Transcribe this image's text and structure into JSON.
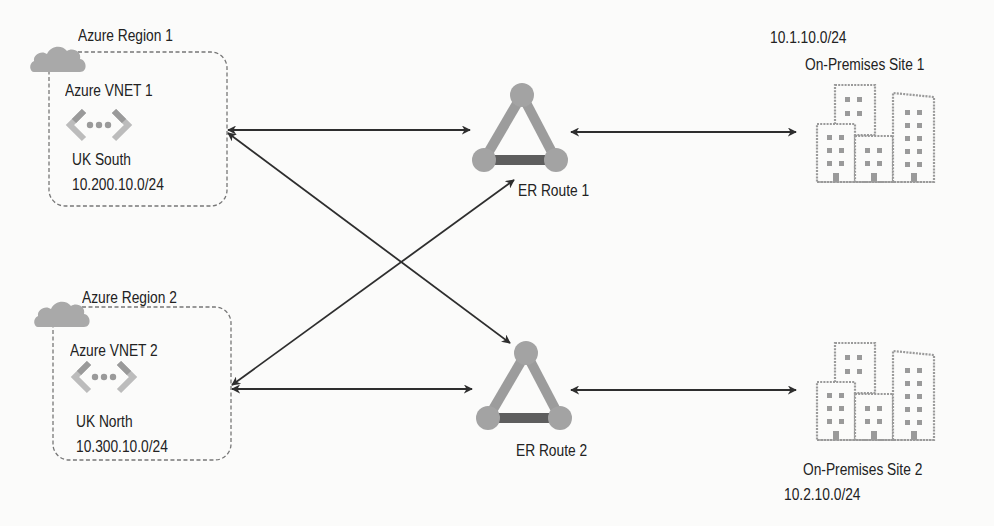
{
  "regions": [
    {
      "title": "Azure Region 1",
      "vnet": "Azure VNET 1",
      "location": "UK South",
      "cidr": "10.200.10.0/24",
      "icons": [
        "cloud-icon",
        "vnet-icon"
      ]
    },
    {
      "title": "Azure Region 2",
      "vnet": "Azure VNET 2",
      "location": "UK North",
      "cidr": "10.300.10.0/24",
      "icons": [
        "cloud-icon",
        "vnet-icon"
      ]
    }
  ],
  "routes": [
    {
      "label": "ER Route 1",
      "icon": "expressroute-circuit-icon"
    },
    {
      "label": "ER Route 2",
      "icon": "expressroute-circuit-icon"
    }
  ],
  "sites": [
    {
      "label": "On-Premises Site 1",
      "cidr": "10.1.10.0/24",
      "icon": "buildings-icon"
    },
    {
      "label": "On-Premises Site 2",
      "cidr": "10.2.10.0/24",
      "icon": "buildings-icon"
    }
  ],
  "connections": [
    {
      "from": "Azure VNET 1",
      "to": "ER Route 1",
      "type": "bidirectional"
    },
    {
      "from": "Azure VNET 1",
      "to": "ER Route 2",
      "type": "bidirectional"
    },
    {
      "from": "Azure VNET 2",
      "to": "ER Route 1",
      "type": "bidirectional"
    },
    {
      "from": "Azure VNET 2",
      "to": "ER Route 2",
      "type": "bidirectional"
    },
    {
      "from": "ER Route 1",
      "to": "On-Premises Site 1",
      "type": "bidirectional"
    },
    {
      "from": "ER Route 2",
      "to": "On-Premises Site 2",
      "type": "bidirectional"
    }
  ],
  "colors": {
    "background": "#fbfbfa",
    "line": "#2e2e2e",
    "cloud": "#a9a9a9",
    "node": "#a3a3a3",
    "edge_light": "#9c9c9c",
    "edge_dark": "#5e5e5e",
    "building": "#9a9a9a",
    "dashed_border": "#777777"
  }
}
